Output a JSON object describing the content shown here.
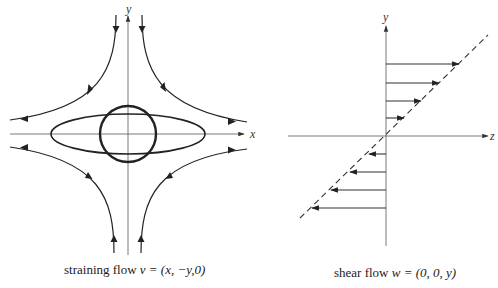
{
  "figure": {
    "left_panel": {
      "title": "straining flow",
      "caption_prefix": "straining flow",
      "caption_formula": "v = (x, −y,0)",
      "x_axis_label": "x",
      "y_axis_label": "y",
      "shapes": [
        "circle",
        "ellipse"
      ],
      "streamlines": [
        "top-left",
        "top-right",
        "bottom-left",
        "bottom-right"
      ]
    },
    "right_panel": {
      "title": "shear flow",
      "caption_prefix": "shear flow",
      "caption_formula": "w = (0, 0, y)",
      "z_axis_label": "z",
      "y_axis_label": "y",
      "velocity_arrows_positive": 4,
      "velocity_arrows_negative": 4,
      "profile_line": "dashed"
    }
  },
  "colors": {
    "ink": "#222222",
    "axis": "#555555",
    "background": "#ffffff"
  }
}
